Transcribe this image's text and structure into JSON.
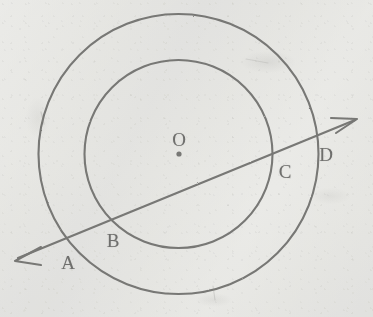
{
  "figure": {
    "stroke_color": "#6f6f6d",
    "background_color": "#f1f1ef",
    "labels": {
      "center": "O",
      "a": "A",
      "b": "B",
      "c": "C",
      "d": "D"
    },
    "label_positions": {
      "center": {
        "x": 179,
        "y": 139
      },
      "a": {
        "x": 68,
        "y": 262
      },
      "b": {
        "x": 113,
        "y": 240
      },
      "c": {
        "x": 285,
        "y": 171
      },
      "d": {
        "x": 326,
        "y": 154
      }
    },
    "center_dot": {
      "x": 179,
      "y": 154,
      "r": 2.6
    },
    "circles": [
      {
        "name": "outer-circle",
        "cx": 178.5,
        "cy": 154,
        "r": 140
      },
      {
        "name": "inner-circle",
        "cx": 178.5,
        "cy": 154,
        "r": 94
      }
    ],
    "secant_line": {
      "name": "secant-line-AD",
      "x1": 18,
      "y1": 258,
      "x2": 355,
      "y2": 120,
      "arrow_start": true,
      "arrow_end": true
    },
    "intersection_points": [
      {
        "label": "A",
        "x": 68,
        "y": 240,
        "circle": "outer-circle"
      },
      {
        "label": "B",
        "x": 113,
        "y": 222,
        "circle": "inner-circle"
      },
      {
        "label": "C",
        "x": 268,
        "y": 159,
        "circle": "inner-circle"
      },
      {
        "label": "D",
        "x": 313,
        "y": 141,
        "circle": "outer-circle"
      }
    ]
  }
}
